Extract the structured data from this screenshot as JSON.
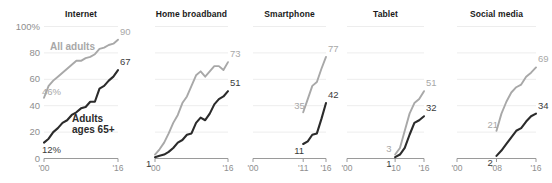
{
  "chart_data": {
    "type": "line",
    "title": "",
    "subtitle": "",
    "xlabel": "",
    "ylabel": "",
    "ylim": [
      0,
      100
    ],
    "yticks": [
      0,
      20,
      40,
      60,
      80,
      100
    ],
    "ytick_labels": [
      "0",
      "20",
      "40",
      "60",
      "80",
      "100%"
    ],
    "grid": true,
    "legend_position": "inline-annotation",
    "legend": [
      {
        "name": "All adults",
        "color": "#a8a8a8"
      },
      {
        "name": "Adults ages 65+",
        "color": "#2b2b2b"
      }
    ],
    "panels": [
      {
        "title": "Internet",
        "xlim": [
          2000,
          2016
        ],
        "xticks": [
          2000,
          2016
        ],
        "xtick_labels": [
          "'00",
          "'16"
        ],
        "series": [
          {
            "name": "All adults",
            "color": "#a8a8a8",
            "start_label": "46%",
            "end_label": "90",
            "x": [
              2000,
              2001,
              2002,
              2003,
              2004,
              2005,
              2006,
              2007,
              2008,
              2009,
              2010,
              2011,
              2012,
              2013,
              2014,
              2015,
              2016
            ],
            "values": [
              46,
              55,
              59,
              62,
              65,
              68,
              71,
              74,
              74,
              76,
              77,
              79,
              83,
              84,
              86,
              87,
              90
            ]
          },
          {
            "name": "Adults ages 65+",
            "color": "#2b2b2b",
            "start_label": "12%",
            "end_label": "67",
            "x": [
              2000,
              2001,
              2002,
              2003,
              2004,
              2005,
              2006,
              2007,
              2008,
              2009,
              2010,
              2011,
              2012,
              2013,
              2014,
              2015,
              2016
            ],
            "values": [
              12,
              15,
              20,
              23,
              27,
              29,
              33,
              35,
              38,
              39,
              43,
              43,
              53,
              55,
              59,
              62,
              67
            ]
          }
        ]
      },
      {
        "title": "Home broadband",
        "xlim": [
          2000,
          2016
        ],
        "xticks": [
          2000,
          2016
        ],
        "xtick_labels": [
          "'00",
          "'16"
        ],
        "series": [
          {
            "name": "All adults",
            "color": "#a8a8a8",
            "start_label": "",
            "end_label": "73",
            "x": [
              2000,
              2001,
              2002,
              2003,
              2004,
              2005,
              2006,
              2007,
              2008,
              2009,
              2010,
              2011,
              2012,
              2013,
              2014,
              2015,
              2016
            ],
            "values": [
              3,
              7,
              12,
              19,
              27,
              33,
              42,
              47,
              55,
              63,
              66,
              62,
              66,
              70,
              70,
              67,
              73
            ]
          },
          {
            "name": "Adults ages 65+",
            "color": "#2b2b2b",
            "start_label": "1",
            "end_label": "51",
            "x": [
              2000,
              2001,
              2002,
              2003,
              2004,
              2005,
              2006,
              2007,
              2008,
              2009,
              2010,
              2011,
              2012,
              2013,
              2014,
              2015,
              2016
            ],
            "values": [
              1,
              2,
              3,
              5,
              8,
              12,
              14,
              18,
              19,
              27,
              31,
              29,
              34,
              41,
              45,
              47,
              51
            ]
          }
        ]
      },
      {
        "title": "Smartphone",
        "xlim": [
          2000,
          2016
        ],
        "xticks": [
          2000,
          2011,
          2016
        ],
        "xtick_labels": [
          "'00",
          "'11",
          "'16"
        ],
        "series": [
          {
            "name": "All adults",
            "color": "#a8a8a8",
            "start_label": "35",
            "end_label": "77",
            "x": [
              2011,
              2012,
              2013,
              2014,
              2015,
              2016
            ],
            "values": [
              35,
              45,
              55,
              58,
              68,
              77
            ]
          },
          {
            "name": "Adults ages 65+",
            "color": "#2b2b2b",
            "start_label": "11",
            "end_label": "42",
            "x": [
              2011,
              2012,
              2013,
              2014,
              2015,
              2016
            ],
            "values": [
              11,
              13,
              18,
              19,
              30,
              42
            ]
          }
        ]
      },
      {
        "title": "Tablet",
        "xlim": [
          2000,
          2016
        ],
        "xticks": [
          2000,
          2010,
          2016
        ],
        "xtick_labels": [
          "'00",
          "'10",
          "'16"
        ],
        "series": [
          {
            "name": "All adults",
            "color": "#a8a8a8",
            "start_label": "3",
            "end_label": "51",
            "x": [
              2010,
              2011,
              2012,
              2013,
              2014,
              2015,
              2016
            ],
            "values": [
              3,
              8,
              21,
              34,
              42,
              45,
              51
            ]
          },
          {
            "name": "Adults ages 65+",
            "color": "#2b2b2b",
            "start_label": "1",
            "end_label": "32",
            "x": [
              2010,
              2011,
              2012,
              2013,
              2014,
              2015,
              2016
            ],
            "values": [
              1,
              3,
              8,
              18,
              27,
              29,
              32
            ]
          }
        ]
      },
      {
        "title": "Social media",
        "xlim": [
          2000,
          2016
        ],
        "xticks": [
          2000,
          2008,
          2016
        ],
        "xtick_labels": [
          "'00",
          "'08",
          "'16"
        ],
        "series": [
          {
            "name": "All adults",
            "color": "#a8a8a8",
            "start_label": "21",
            "end_label": "69",
            "x": [
              2008,
              2009,
              2010,
              2011,
              2012,
              2013,
              2014,
              2015,
              2016
            ],
            "values": [
              21,
              34,
              43,
              50,
              54,
              56,
              62,
              65,
              69
            ]
          },
          {
            "name": "Adults ages 65+",
            "color": "#2b2b2b",
            "start_label": "2",
            "end_label": "34",
            "x": [
              2008,
              2009,
              2010,
              2011,
              2012,
              2013,
              2014,
              2015,
              2016
            ],
            "values": [
              2,
              6,
              11,
              16,
              21,
              23,
              28,
              32,
              34
            ]
          }
        ]
      }
    ]
  }
}
